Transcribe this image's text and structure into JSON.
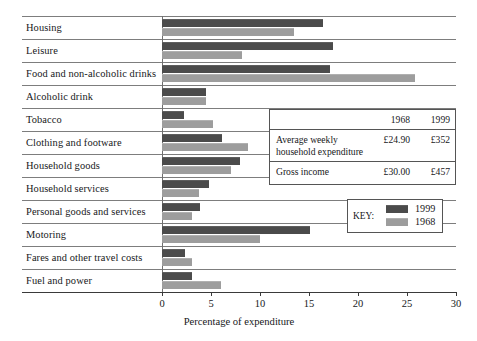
{
  "chart_data": {
    "type": "bar",
    "orientation": "horizontal",
    "title": "",
    "xlabel": "Percentage of expenditure",
    "ylabel": "",
    "xlim": [
      0,
      30
    ],
    "xticks": [
      0,
      5,
      10,
      15,
      20,
      25,
      30
    ],
    "grid": false,
    "legend_position": "inside-right",
    "categories": [
      "Housing",
      "Leisure",
      "Food and non-alcoholic drinks",
      "Alcoholic drink",
      "Tobacco",
      "Clothing and footware",
      "Household goods",
      "Household services",
      "Personal goods and services",
      "Motoring",
      "Fares and other travel costs",
      "Fuel and power"
    ],
    "series": [
      {
        "name": "1999",
        "color": "#4b4b4b",
        "values": [
          16.4,
          17.4,
          17.1,
          4.5,
          2.2,
          6.1,
          8.0,
          4.8,
          3.9,
          15.1,
          2.3,
          3.1
        ]
      },
      {
        "name": "1968",
        "color": "#9d9d9d",
        "values": [
          13.5,
          8.2,
          25.8,
          4.5,
          5.2,
          8.8,
          7.0,
          3.8,
          3.1,
          10.0,
          3.1,
          6.0
        ]
      }
    ]
  },
  "legend": {
    "title": "KEY:",
    "entries": [
      {
        "label": "1999",
        "swatch": "dark"
      },
      {
        "label": "1968",
        "swatch": "light"
      }
    ]
  },
  "inset_table": {
    "col_headers": [
      "",
      "1968",
      "1999"
    ],
    "rows": [
      {
        "label": "Average weekly\nhousehold expenditure",
        "v1968": "£24.90",
        "v1999": "£352"
      },
      {
        "label": "Gross income",
        "v1968": "£30.00",
        "v1999": "£457"
      }
    ]
  }
}
